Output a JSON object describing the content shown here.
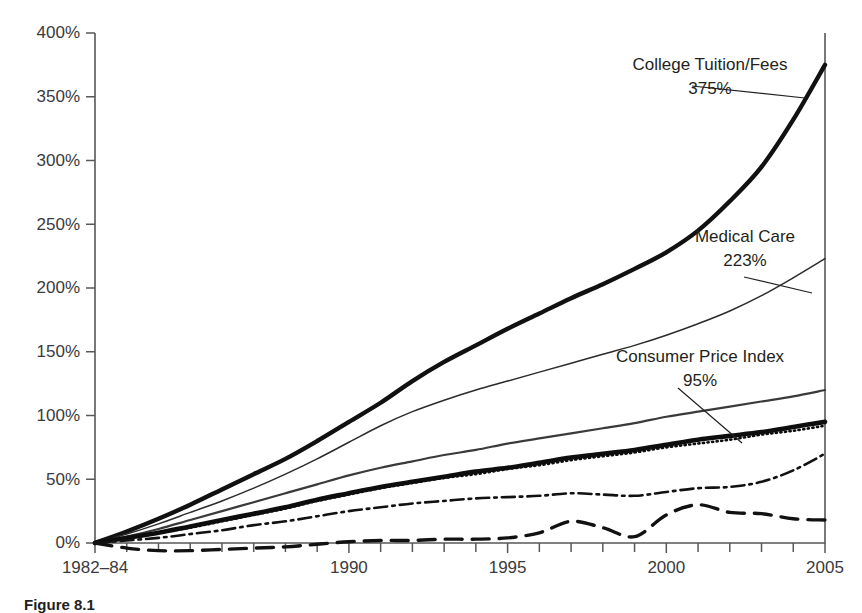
{
  "figure": {
    "caption": "Figure 8.1"
  },
  "chart_data": {
    "type": "line",
    "title": "",
    "subtitle": "",
    "xlabel": "",
    "ylabel": "",
    "grid": false,
    "legend_position": "inline-annotations",
    "xlim": [
      1982,
      2005
    ],
    "ylim": [
      0,
      400
    ],
    "y_ticks": [
      "0%",
      "50%",
      "100%",
      "150%",
      "200%",
      "250%",
      "300%",
      "350%",
      "400%"
    ],
    "y_tick_values": [
      0,
      50,
      100,
      150,
      200,
      250,
      300,
      350,
      400
    ],
    "x_ticks": [
      "1982–84",
      "1990",
      "1995",
      "2000",
      "2005"
    ],
    "x_tick_values": [
      1982,
      1990,
      1995,
      2000,
      2005
    ],
    "x_minor_tick_values": [
      1983,
      1984,
      1985,
      1986,
      1987,
      1988,
      1989,
      1991,
      1992,
      1993,
      1994,
      1996,
      1997,
      1998,
      1999,
      2001,
      2002,
      2003,
      2004
    ],
    "x": [
      1982,
      1983,
      1984,
      1985,
      1986,
      1987,
      1988,
      1989,
      1990,
      1991,
      1992,
      1993,
      1994,
      1995,
      1996,
      1997,
      1998,
      1999,
      2000,
      2001,
      2002,
      2003,
      2004,
      2005
    ],
    "series": [
      {
        "name": "College Tuition/Fees",
        "style": "thick-solid",
        "end_label": "375%",
        "end_value": 375,
        "values": [
          0,
          9,
          19,
          30,
          42,
          54,
          66,
          80,
          95,
          110,
          127,
          142,
          155,
          168,
          180,
          192,
          203,
          215,
          228,
          245,
          268,
          295,
          332,
          375
        ]
      },
      {
        "name": "Medical Care",
        "style": "thin-solid",
        "end_label": "223%",
        "end_value": 223,
        "values": [
          0,
          7,
          15,
          24,
          33,
          43,
          54,
          66,
          79,
          92,
          103,
          112,
          120,
          127,
          134,
          141,
          148,
          155,
          163,
          172,
          182,
          194,
          208,
          223
        ]
      },
      {
        "name": "",
        "style": "medium-solid",
        "end_label": "",
        "end_value": 120,
        "values": [
          0,
          5,
          11,
          18,
          25,
          32,
          39,
          46,
          53,
          59,
          64,
          69,
          73,
          78,
          82,
          86,
          90,
          94,
          99,
          103,
          107,
          111,
          115,
          120
        ]
      },
      {
        "name": "Consumer Price Index",
        "style": "thick-solid",
        "end_label": "95%",
        "end_value": 95,
        "values": [
          0,
          4,
          8,
          13,
          18,
          23,
          28,
          34,
          39,
          44,
          48,
          52,
          56,
          59,
          63,
          67,
          70,
          73,
          77,
          81,
          84,
          87,
          91,
          95
        ]
      },
      {
        "name": "",
        "style": "dotted",
        "end_label": "",
        "end_value": 92,
        "values": [
          0,
          4,
          8,
          12,
          17,
          22,
          27,
          33,
          38,
          43,
          47,
          51,
          54,
          58,
          61,
          65,
          68,
          71,
          75,
          78,
          81,
          85,
          88,
          92
        ]
      },
      {
        "name": "",
        "style": "dash-dot",
        "end_label": "",
        "end_value": 70,
        "values": [
          0,
          2,
          4,
          7,
          10,
          14,
          17,
          21,
          25,
          28,
          31,
          33,
          35,
          36,
          37,
          39,
          38,
          37,
          40,
          43,
          44,
          48,
          57,
          70
        ]
      },
      {
        "name": "",
        "style": "dashed",
        "end_label": "",
        "end_value": 18,
        "values": [
          0,
          -4,
          -6,
          -6,
          -5,
          -4,
          -3,
          -1,
          1,
          2,
          2,
          3,
          3,
          4,
          8,
          17,
          12,
          5,
          22,
          30,
          24,
          23,
          19,
          18
        ]
      }
    ],
    "annotations": [
      {
        "name": "College Tuition/Fees",
        "value": "375%",
        "text_x": 710,
        "text_y": 70,
        "leader": [
          [
            692,
            86
          ],
          [
            805,
            98
          ]
        ]
      },
      {
        "name": "Medical Care",
        "value": "223%",
        "text_x": 745,
        "text_y": 242,
        "leader": [
          [
            744,
            277
          ],
          [
            812,
            293
          ]
        ]
      },
      {
        "name": "Consumer Price Index",
        "value": "95%",
        "text_x": 700,
        "text_y": 362,
        "leader": [
          [
            678,
            388
          ],
          [
            742,
            443
          ]
        ]
      }
    ]
  }
}
